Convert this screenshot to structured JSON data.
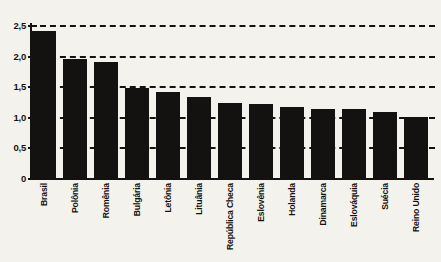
{
  "chart_data": {
    "type": "bar",
    "title": "",
    "subtitle": "",
    "xlabel": "",
    "ylabel": "",
    "categories": [
      "Brasil",
      "Polônia",
      "Romênia",
      "Bulgária",
      "Letônia",
      "Lituânia",
      "República Checa",
      "Eslovênia",
      "Holanda",
      "Dinamarca",
      "Eslováquia",
      "Suécia",
      "Reino Unido"
    ],
    "values": [
      2.4,
      1.95,
      1.9,
      1.47,
      1.4,
      1.32,
      1.22,
      1.21,
      1.16,
      1.13,
      1.12,
      1.08,
      1.0
    ],
    "ylim": [
      0,
      2.5
    ],
    "ytick_values": [
      0,
      0.5,
      1.0,
      1.5,
      2.0,
      2.5
    ],
    "ytick_labels": [
      "0",
      "0,5",
      "1,0",
      "1,5",
      "2,0",
      "2,5"
    ],
    "grid": true,
    "grid_style": "dashed-horizontal",
    "legend": false,
    "legend_position": "none",
    "bar_color": "#141210",
    "background_color": "#f4f2ec",
    "axis_color": "#141210",
    "annotations": []
  }
}
